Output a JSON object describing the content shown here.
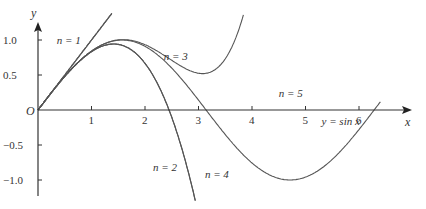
{
  "chart_data": {
    "type": "line",
    "title": "",
    "xlabel": "x",
    "ylabel": "y",
    "origin_label": "O",
    "xlim": [
      0,
      6.8
    ],
    "ylim": [
      -1.25,
      1.2
    ],
    "grid": false,
    "x_ticks": [
      1,
      2,
      3,
      4,
      5,
      6
    ],
    "x_tick_labels": [
      "1",
      "2",
      "3",
      "4",
      "5",
      "6"
    ],
    "y_ticks": [
      1.0,
      0.5,
      -0.5,
      -1.0
    ],
    "y_tick_labels": [
      "1.0",
      "0.5",
      "-0.5",
      "-1.0"
    ],
    "series": [
      {
        "name": "y = sin x",
        "kind": "sin",
        "label": "y = sin x",
        "label_pos": [
          5.3,
          -0.22
        ]
      },
      {
        "name": "n = 1",
        "kind": "taylor",
        "order": 1,
        "label": "n = 1",
        "label_pos": [
          0.35,
          0.95
        ]
      },
      {
        "name": "n = 2",
        "kind": "taylor",
        "order": 2,
        "label": "n = 2",
        "label_pos": [
          2.15,
          -0.87
        ]
      },
      {
        "name": "n = 3",
        "kind": "taylor",
        "order": 3,
        "label": "n = 3",
        "label_pos": [
          2.35,
          0.72
        ]
      },
      {
        "name": "n = 4",
        "kind": "taylor",
        "order": 4,
        "label": "n = 4",
        "label_pos": [
          3.12,
          -0.97
        ]
      },
      {
        "name": "n = 5",
        "kind": "taylor",
        "order": 5,
        "label": "n = 5",
        "label_pos": [
          4.5,
          0.18
        ]
      }
    ],
    "annotations": [
      "n = 1",
      "n = 2",
      "n = 3",
      "n = 4",
      "n = 5",
      "y = sin x"
    ],
    "colors": {
      "curve": "#555555",
      "axis": "#333333",
      "text": "#333333"
    }
  }
}
